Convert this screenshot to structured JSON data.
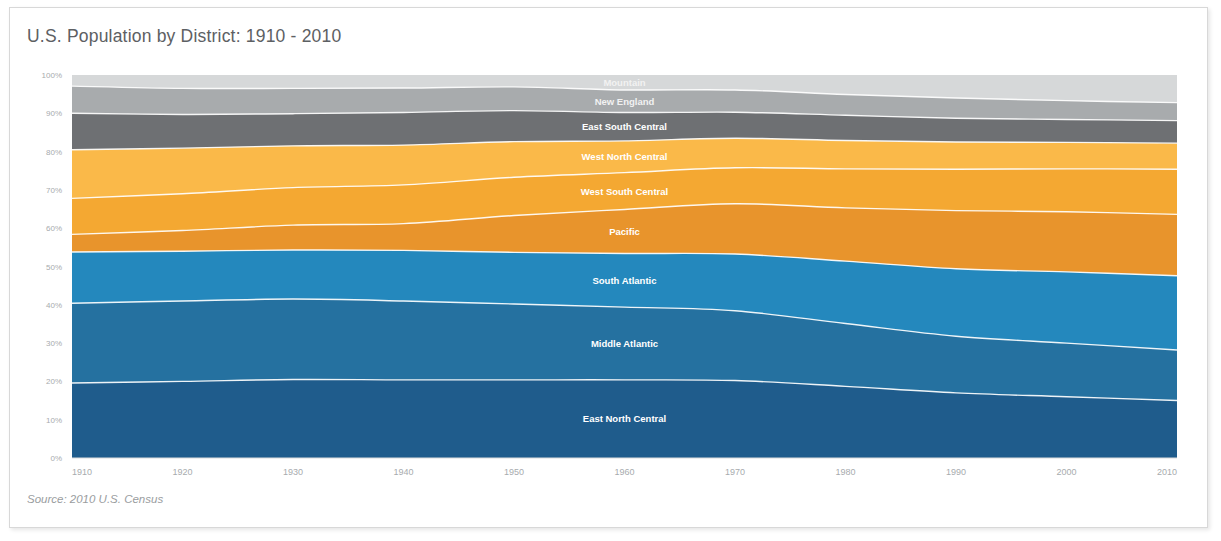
{
  "card": {
    "title": "U.S. Population by District: 1910 - 2010",
    "source": "Source: 2010 U.S. Census"
  },
  "chart_data": {
    "type": "area",
    "stacked": true,
    "normalized": true,
    "title": "U.S. Population by District: 1910 - 2010",
    "xlabel": "",
    "ylabel": "",
    "xlim": [
      1910,
      2010
    ],
    "ylim": [
      0,
      100
    ],
    "grid": false,
    "legend": "inline-labels",
    "x": [
      1910,
      1920,
      1930,
      1940,
      1950,
      1960,
      1970,
      1980,
      1990,
      2000,
      2010
    ],
    "xtick_labels": [
      "1910",
      "1920",
      "1930",
      "1940",
      "1950",
      "1960",
      "1970",
      "1980",
      "1990",
      "2000",
      "2010"
    ],
    "ytick_labels": [
      "0%",
      "10%",
      "20%",
      "30%",
      "40%",
      "50%",
      "60%",
      "70%",
      "80%",
      "90%",
      "100%"
    ],
    "ytick_values": [
      0,
      10,
      20,
      30,
      40,
      50,
      60,
      70,
      80,
      90,
      100
    ],
    "series": [
      {
        "name": "East North Central",
        "color": "#1f5c8c",
        "label_x": 1960,
        "values": [
          19.6,
          20.0,
          20.5,
          20.4,
          20.4,
          20.4,
          20.2,
          18.7,
          17.0,
          16.0,
          15.0
        ]
      },
      {
        "name": "Middle Atlantic",
        "color": "#2571a0",
        "label_x": 1960,
        "values": [
          20.8,
          21.0,
          21.0,
          20.6,
          19.8,
          19.0,
          18.2,
          16.4,
          14.8,
          14.0,
          13.2
        ]
      },
      {
        "name": "South Atlantic",
        "color": "#2488bd",
        "label_x": 1960,
        "values": [
          13.4,
          13.0,
          12.8,
          13.2,
          13.5,
          14.0,
          14.8,
          16.3,
          17.6,
          18.6,
          19.4
        ]
      },
      {
        "name": "Pacific",
        "color": "#e8942c",
        "label_x": 1960,
        "values": [
          4.6,
          5.4,
          6.5,
          7.0,
          9.6,
          11.5,
          13.1,
          13.9,
          15.2,
          15.7,
          16.0
        ]
      },
      {
        "name": "West South Central",
        "color": "#f4a832",
        "label_x": 1960,
        "values": [
          9.4,
          9.6,
          9.8,
          10.1,
          10.0,
          9.6,
          9.4,
          10.2,
          10.8,
          11.2,
          11.8
        ]
      },
      {
        "name": "West North Central",
        "color": "#fab949",
        "label_x": 1960,
        "values": [
          12.7,
          11.9,
          10.9,
          10.4,
          9.3,
          8.3,
          7.7,
          7.4,
          7.1,
          6.9,
          6.8
        ]
      },
      {
        "name": "East South Central",
        "color": "#6e7073",
        "label_x": 1960,
        "values": [
          9.5,
          8.8,
          8.4,
          8.5,
          8.1,
          7.4,
          6.8,
          6.6,
          6.2,
          6.0,
          5.9
        ]
      },
      {
        "name": "New England",
        "color": "#a8abad",
        "label_x": 1960,
        "values": [
          7.1,
          6.8,
          6.6,
          6.4,
          6.2,
          5.9,
          5.8,
          5.4,
          5.3,
          4.9,
          4.7
        ]
      },
      {
        "name": "Mountain",
        "color": "#d6d8d9",
        "label_x": 1960,
        "values": [
          2.9,
          3.5,
          3.5,
          3.4,
          3.1,
          3.9,
          3.9,
          5.1,
          6.0,
          6.7,
          7.2
        ]
      }
    ]
  }
}
